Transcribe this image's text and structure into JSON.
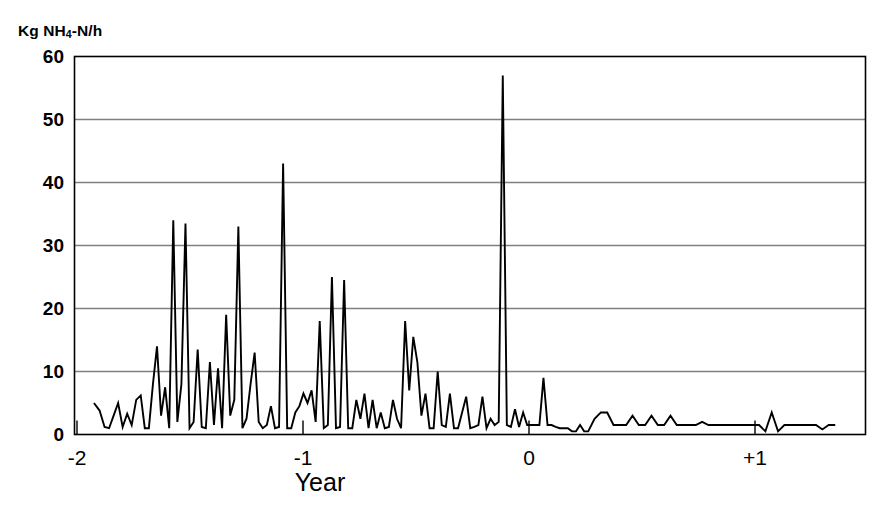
{
  "chart_data": {
    "type": "line",
    "title": "",
    "ylabel": "Kg NH4-N/h",
    "ylabel_parts": {
      "prefix": "Kg NH",
      "sub": "4",
      "suffix": "-N/h"
    },
    "xlabel": "Year",
    "xlim": [
      -1.93,
      1.37
    ],
    "ylim": [
      0,
      60
    ],
    "yticks": [
      0,
      10,
      20,
      30,
      40,
      50,
      60
    ],
    "ytick_labels": [
      "0",
      "10",
      "20",
      "30",
      "40",
      "50",
      "60"
    ],
    "xticks": [
      -2,
      -1,
      0,
      1
    ],
    "xtick_labels": [
      "-2",
      "-1",
      "0",
      "+1"
    ],
    "grid": "horizontal",
    "legend": "none",
    "line_color": "#000000",
    "grid_color": "#808080",
    "axis_color": "#000000",
    "series": [
      {
        "name": "NH4-N load",
        "x": [
          -1.925,
          -1.9,
          -1.878,
          -1.858,
          -1.838,
          -1.818,
          -1.798,
          -1.778,
          -1.758,
          -1.738,
          -1.718,
          -1.7,
          -1.682,
          -1.664,
          -1.646,
          -1.628,
          -1.61,
          -1.592,
          -1.574,
          -1.556,
          -1.538,
          -1.52,
          -1.502,
          -1.484,
          -1.466,
          -1.448,
          -1.43,
          -1.412,
          -1.394,
          -1.376,
          -1.358,
          -1.34,
          -1.322,
          -1.304,
          -1.286,
          -1.268,
          -1.25,
          -1.232,
          -1.214,
          -1.196,
          -1.178,
          -1.16,
          -1.142,
          -1.124,
          -1.106,
          -1.088,
          -1.07,
          -1.052,
          -1.034,
          -1.016,
          -0.998,
          -0.98,
          -0.962,
          -0.944,
          -0.926,
          -0.908,
          -0.89,
          -0.872,
          -0.854,
          -0.836,
          -0.818,
          -0.8,
          -0.782,
          -0.764,
          -0.746,
          -0.728,
          -0.71,
          -0.692,
          -0.674,
          -0.656,
          -0.638,
          -0.62,
          -0.602,
          -0.584,
          -0.566,
          -0.548,
          -0.53,
          -0.512,
          -0.494,
          -0.476,
          -0.458,
          -0.44,
          -0.422,
          -0.404,
          -0.386,
          -0.368,
          -0.35,
          -0.332,
          -0.314,
          -0.296,
          -0.278,
          -0.26,
          -0.242,
          -0.224,
          -0.206,
          -0.188,
          -0.17,
          -0.152,
          -0.134,
          -0.116,
          -0.098,
          -0.08,
          -0.062,
          -0.044,
          -0.026,
          -0.008,
          0.01,
          0.028,
          0.046,
          0.064,
          0.082,
          0.1,
          0.118,
          0.136,
          0.154,
          0.172,
          0.19,
          0.208,
          0.226,
          0.244,
          0.262,
          0.29,
          0.318,
          0.346,
          0.374,
          0.402,
          0.43,
          0.458,
          0.486,
          0.514,
          0.542,
          0.57,
          0.598,
          0.626,
          0.654,
          0.682,
          0.71,
          0.738,
          0.766,
          0.794,
          0.822,
          0.85,
          0.878,
          0.906,
          0.934,
          0.962,
          0.99,
          1.018,
          1.046,
          1.074,
          1.102,
          1.13,
          1.158,
          1.186,
          1.214,
          1.242,
          1.27,
          1.298,
          1.326,
          1.355
        ],
        "values": [
          5.0,
          3.8,
          1.2,
          1.0,
          3.0,
          5.0,
          1.2,
          3.3,
          1.5,
          5.5,
          6.2,
          1.0,
          1.0,
          8.0,
          14.0,
          3.0,
          7.5,
          1.0,
          34.0,
          2.0,
          8.0,
          33.5,
          1.0,
          2.0,
          13.5,
          1.2,
          1.0,
          11.5,
          1.5,
          10.5,
          1.0,
          19.0,
          3.0,
          5.5,
          33.0,
          1.0,
          2.5,
          8.0,
          13.0,
          2.0,
          1.0,
          1.5,
          4.5,
          1.0,
          1.2,
          43.0,
          1.0,
          1.0,
          3.5,
          4.5,
          6.5,
          5.0,
          7.0,
          2.0,
          18.0,
          1.0,
          1.5,
          25.0,
          1.0,
          1.2,
          24.5,
          1.0,
          1.0,
          5.5,
          2.5,
          6.5,
          1.0,
          5.5,
          1.0,
          3.5,
          1.0,
          1.2,
          5.5,
          2.5,
          1.0,
          18.0,
          7.0,
          15.5,
          11.5,
          3.0,
          6.5,
          1.0,
          1.0,
          10.0,
          1.5,
          1.2,
          6.5,
          1.0,
          1.0,
          3.5,
          6.0,
          1.0,
          1.2,
          1.5,
          6.0,
          1.0,
          2.5,
          1.5,
          2.0,
          57.0,
          1.5,
          1.2,
          4.0,
          1.2,
          3.5,
          1.5,
          1.5,
          1.5,
          1.5,
          9.0,
          1.5,
          1.5,
          1.2,
          1.0,
          1.0,
          1.0,
          0.5,
          0.5,
          1.5,
          0.5,
          0.5,
          2.5,
          3.5,
          3.5,
          1.5,
          1.5,
          1.5,
          3.0,
          1.5,
          1.5,
          3.0,
          1.5,
          1.5,
          3.0,
          1.5,
          1.5,
          1.5,
          1.5,
          2.0,
          1.5,
          1.5,
          1.5,
          1.5,
          1.5,
          1.5,
          1.5,
          1.5,
          1.5,
          0.5,
          3.5,
          0.5,
          1.5,
          1.5,
          1.5,
          1.5,
          1.5,
          1.5,
          0.8,
          1.5,
          1.5
        ]
      }
    ]
  },
  "axes": {
    "y_title_prefix": "Kg NH",
    "y_title_sub": "4",
    "y_title_suffix": "-N/h",
    "x_title": "Year"
  }
}
